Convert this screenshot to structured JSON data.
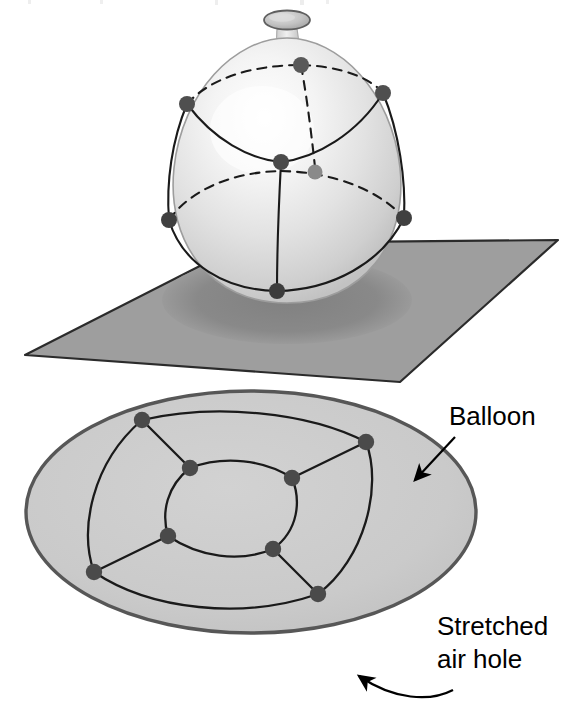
{
  "figure": {
    "background_color": "#ffffff"
  },
  "top_scene": {
    "name": "balloon-on-plane",
    "plane": {
      "fill_color": "#9e9e9e",
      "stroke_color": "#2b2b2b",
      "corners": "25,355 245,243 558,240 400,382"
    },
    "shadow": {
      "fill_color": "#8a8a8a"
    },
    "balloon": {
      "body_fill_light": "#fcfcfc",
      "body_fill_mid": "#e3e3e3",
      "body_fill_dark": "#c9c9c9",
      "outline_color": "#9a9a9a",
      "nozzle_fill": "#bdbdbd",
      "nozzle_stroke": "#6e6e6e"
    },
    "graph": {
      "vertex_color": "#555555",
      "vertex_color_hidden": "#6f6f6f",
      "edge_color": "#1a1a1a",
      "visible_edge_style": "solid",
      "hidden_edge_style": "dashed",
      "vertex_count": 8,
      "edge_count": 12
    }
  },
  "bottom_scene": {
    "name": "stretched-planar-embedding",
    "disk": {
      "fill_color": "#c9c9c9",
      "stroke_color": "#555555",
      "center_x": 251,
      "center_y": 512,
      "radius_x": 225,
      "radius_y": 121
    },
    "graph": {
      "vertex_color": "#4a4a4a",
      "edge_color": "#1a1a1a",
      "vertex_count": 8,
      "edge_count": 12
    }
  },
  "annotations": {
    "balloon_label": {
      "text": "Balloon",
      "x": 449,
      "y": 425
    },
    "stretched_air_hole_label_line1": {
      "text": "Stretched",
      "x": 437,
      "y": 635
    },
    "stretched_air_hole_label_line2": {
      "text": "air hole",
      "x": 437,
      "y": 668
    },
    "arrow_color": "#000000"
  },
  "top_crop": {
    "text": ""
  }
}
